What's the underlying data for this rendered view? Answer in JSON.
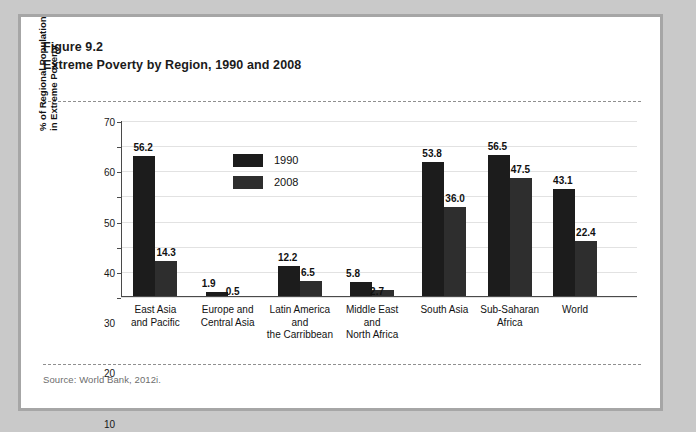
{
  "figure": {
    "number": "Figure 9.2",
    "title": "Extreme Poverty by Region, 1990 and 2008",
    "source": "Source: World Bank, 2012i."
  },
  "chart_data": {
    "type": "bar",
    "title": "Extreme Poverty by Region, 1990 and 2008",
    "xlabel": "",
    "ylabel_lines": [
      "% of Regional Population",
      "in Extreme Poverty"
    ],
    "ylabel": "% of Regional Population in Extreme Poverty",
    "ylim": [
      0,
      70
    ],
    "yticks": [
      0,
      10,
      20,
      30,
      40,
      50,
      60,
      70
    ],
    "grid": true,
    "legend_position": "inside-top-left",
    "categories": [
      "East Asia and Pacific",
      "Europe and Central Asia",
      "Latin America and the Carribbean",
      "Middle East and North Africa",
      "South Asia",
      "Sub-Saharan Africa",
      "World"
    ],
    "category_lines": [
      [
        "East Asia",
        "and Pacific"
      ],
      [
        "Europe and",
        "Central Asia"
      ],
      [
        "Latin America",
        "and",
        "the Carribbean"
      ],
      [
        "Middle East",
        "and",
        "North Africa"
      ],
      [
        "South Asia"
      ],
      [
        "Sub-Saharan",
        "Africa"
      ],
      [
        "World"
      ]
    ],
    "series": [
      {
        "name": "1990",
        "color": "#1c1c1c",
        "values": [
          56.2,
          1.9,
          12.2,
          5.8,
          53.8,
          56.5,
          43.1
        ],
        "labels": [
          "56.2",
          "1.9",
          "12.2",
          "5.8",
          "53.8",
          "56.5",
          "43.1"
        ]
      },
      {
        "name": "2008",
        "color": "#2e2e2e",
        "values": [
          14.3,
          0.5,
          6.5,
          2.7,
          36.0,
          47.5,
          22.4
        ],
        "labels": [
          "14.3",
          "0.5",
          "6.5",
          "2.7",
          "36.0",
          "47.5",
          "22.4"
        ]
      }
    ]
  },
  "colors": {
    "page_background": "#c9c9c9",
    "card_background": "#ffffff",
    "card_border": "#a6a6a6",
    "series_1990": "#1c1c1c",
    "series_2008": "#2e2e2e",
    "gridline": "#e2e2e2",
    "axis": "#4a4a4a",
    "source_text": "#6d6d6d"
  }
}
